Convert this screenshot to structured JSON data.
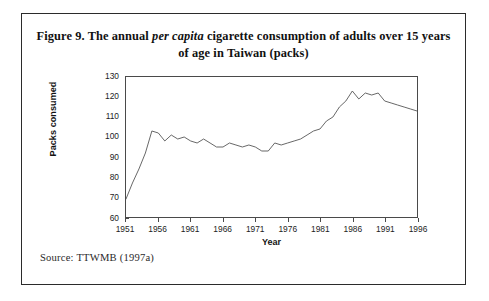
{
  "figure": {
    "title_prefix": "Figure 9. The annual ",
    "title_italic": "per capita",
    "title_suffix": " cigarette consumption of adults over 15 years of age in Taiwan (packs)",
    "title_full": "Figure 9. The annual per capita cigarette consumption of adults over 15 years of age in Taiwan (packs)",
    "source": "Source: TTWMB (1997a)",
    "line_color": "#555555",
    "axis_color": "#4a4a4a",
    "border_color": "#2b2b2b",
    "background": "#ffffff"
  },
  "chart_data": {
    "type": "line",
    "title": "Figure 9. The annual per capita cigarette consumption of adults over 15 years of age in Taiwan (packs)",
    "xlabel": "Year",
    "ylabel": "Packs consumed",
    "xlim": [
      1951,
      1996
    ],
    "ylim": [
      60,
      130
    ],
    "ytick_step": 10,
    "xtick_step": 5,
    "yticks": [
      60,
      70,
      80,
      90,
      100,
      110,
      120,
      130
    ],
    "xticks": [
      1951,
      1956,
      1961,
      1966,
      1971,
      1976,
      1981,
      1986,
      1991,
      1996
    ],
    "grid": false,
    "legend": null,
    "series": [
      {
        "name": "Packs consumed per capita",
        "x": [
          1951,
          1952,
          1953,
          1954,
          1955,
          1956,
          1957,
          1958,
          1959,
          1960,
          1961,
          1962,
          1963,
          1964,
          1965,
          1966,
          1967,
          1968,
          1969,
          1970,
          1971,
          1972,
          1973,
          1974,
          1975,
          1976,
          1977,
          1978,
          1979,
          1980,
          1981,
          1982,
          1983,
          1984,
          1985,
          1986,
          1987,
          1988,
          1989,
          1990,
          1991,
          1992,
          1993,
          1994,
          1995,
          1996
        ],
        "values": [
          69,
          77,
          84,
          92,
          103,
          102,
          98,
          101,
          99,
          100,
          98,
          97,
          99,
          97,
          95,
          95,
          97,
          96,
          95,
          96,
          95,
          93,
          93,
          97,
          96,
          97,
          98,
          99,
          101,
          103,
          104,
          108,
          110,
          115,
          118,
          123,
          119,
          122,
          121,
          122,
          118,
          117,
          116,
          115,
          114,
          113
        ]
      }
    ]
  }
}
